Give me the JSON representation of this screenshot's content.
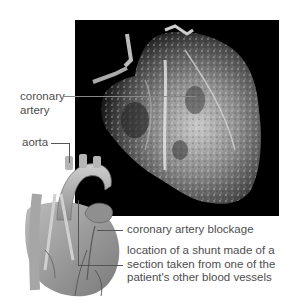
{
  "figure": {
    "photo": {
      "description": "resin cast of heart coronary vessels",
      "background_color": "#000000"
    },
    "illustration": {
      "description": "heart illustration with coronary bypass shunt"
    },
    "labels": {
      "coronary_artery_line1": "coronary",
      "coronary_artery_line2": "artery",
      "aorta": "aorta",
      "coronary_artery_blockage": "coronary artery blockage",
      "shunt_line1": "location of a shunt made of a",
      "shunt_line2": "section taken from one of the",
      "shunt_line3": "patient's other blood vessels"
    }
  }
}
